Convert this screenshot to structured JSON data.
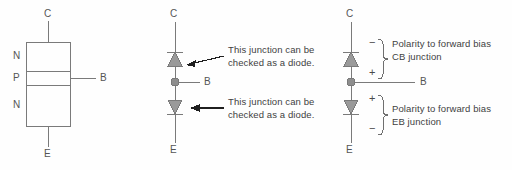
{
  "figure": {
    "background_color": "#fefefe",
    "line_color": "#7a7a7a",
    "fill_color": "#9a9a9a",
    "text_color": "#3f3f3f"
  },
  "panel_block": {
    "name": "npn-block-diagram",
    "terminal_top": "C",
    "terminal_bottom": "E",
    "terminal_side": "B",
    "layers": [
      "N",
      "P",
      "N"
    ]
  },
  "panel_diodes": {
    "name": "two-diode-equivalent",
    "terminal_top": "C",
    "terminal_bottom": "E",
    "terminal_side": "B",
    "note_top": "This junction can be\nchecked as a diode.",
    "note_bottom": "This junction can be\nchecked as a diode."
  },
  "panel_polarity": {
    "name": "forward-bias-polarity",
    "terminal_top": "C",
    "terminal_bottom": "E",
    "terminal_side": "B",
    "cb": {
      "sign_top": "−",
      "sign_bottom": "+",
      "note": "Polarity to forward bias\nCB junction"
    },
    "eb": {
      "sign_top": "+",
      "sign_bottom": "−",
      "note": "Polarity to forward bias\nEB junction"
    }
  }
}
